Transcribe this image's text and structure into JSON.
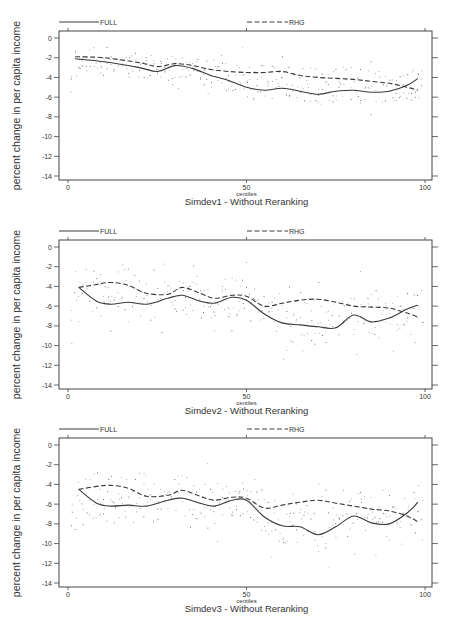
{
  "figure": {
    "panels_count": 3
  },
  "chart_data": [
    {
      "type": "line",
      "title": "Simdev1 - Without Reranking",
      "xlabel": "centiles",
      "ylabel": "percent change in per capita income",
      "xlim": [
        0,
        100
      ],
      "ylim": [
        -14,
        0
      ],
      "xticks": [
        0,
        50,
        100
      ],
      "yticks": [
        0,
        -2,
        -4,
        -6,
        -8,
        -10,
        -12,
        -14
      ],
      "grid": false,
      "legend": {
        "position": "top",
        "entries": [
          "FULL",
          "RHG"
        ]
      },
      "x": [
        2,
        10,
        20,
        25,
        30,
        35,
        40,
        45,
        50,
        55,
        60,
        65,
        70,
        75,
        80,
        85,
        90,
        95,
        98
      ],
      "series": [
        {
          "name": "FULL",
          "style": "solid",
          "values": [
            -2.1,
            -2.4,
            -3.0,
            -3.4,
            -2.8,
            -3.1,
            -3.8,
            -4.3,
            -5.0,
            -5.3,
            -5.1,
            -5.4,
            -5.7,
            -5.4,
            -5.3,
            -5.5,
            -5.4,
            -4.8,
            -4.1
          ]
        },
        {
          "name": "RHG",
          "style": "dashed",
          "values": [
            -1.9,
            -2.0,
            -2.5,
            -2.9,
            -2.6,
            -2.8,
            -3.2,
            -3.4,
            -3.5,
            -3.5,
            -3.4,
            -3.8,
            -4.0,
            -4.1,
            -4.2,
            -4.4,
            -4.6,
            -5.0,
            -5.3
          ]
        }
      ],
      "scatter_note": "raw centile observations shown as faint dots around both curves"
    },
    {
      "type": "line",
      "title": "Simdev2 - Without Reranking",
      "xlabel": "centiles",
      "ylabel": "percent change in per capita income",
      "xlim": [
        0,
        100
      ],
      "ylim": [
        -14,
        0
      ],
      "xticks": [
        0,
        50,
        100
      ],
      "yticks": [
        0,
        -2,
        -4,
        -6,
        -8,
        -10,
        -12,
        -14
      ],
      "grid": false,
      "legend": {
        "position": "top",
        "entries": [
          "FULL",
          "RHG"
        ]
      },
      "x": [
        3,
        8,
        12,
        17,
        22,
        28,
        32,
        37,
        41,
        46,
        50,
        55,
        60,
        65,
        70,
        75,
        80,
        85,
        90,
        95,
        98
      ],
      "series": [
        {
          "name": "FULL",
          "style": "solid",
          "values": [
            -4.1,
            -5.5,
            -5.8,
            -5.6,
            -5.8,
            -5.2,
            -4.9,
            -5.5,
            -5.7,
            -5.1,
            -5.4,
            -6.8,
            -7.7,
            -7.9,
            -8.1,
            -8.2,
            -6.9,
            -7.6,
            -7.2,
            -6.3,
            -5.9
          ]
        },
        {
          "name": "RHG",
          "style": "dashed",
          "values": [
            -4.1,
            -3.8,
            -3.6,
            -3.9,
            -4.7,
            -4.8,
            -4.1,
            -4.7,
            -5.2,
            -4.9,
            -5.0,
            -6.0,
            -5.7,
            -5.4,
            -5.3,
            -5.6,
            -6.0,
            -6.1,
            -6.2,
            -6.7,
            -7.1
          ]
        }
      ],
      "scatter_note": "raw centile observations shown as faint dots around both curves"
    },
    {
      "type": "line",
      "title": "Simdev3 - Without Reranking",
      "xlabel": "centiles",
      "ylabel": "percent change in per capita income",
      "xlim": [
        0,
        100
      ],
      "ylim": [
        -14,
        0
      ],
      "xticks": [
        0,
        50,
        100
      ],
      "yticks": [
        0,
        -2,
        -4,
        -6,
        -8,
        -10,
        -12,
        -14
      ],
      "grid": false,
      "legend": {
        "position": "top",
        "entries": [
          "FULL",
          "RHG"
        ]
      },
      "x": [
        3,
        8,
        12,
        17,
        22,
        28,
        32,
        37,
        41,
        46,
        50,
        55,
        60,
        65,
        70,
        75,
        80,
        85,
        90,
        95,
        98
      ],
      "series": [
        {
          "name": "FULL",
          "style": "solid",
          "values": [
            -4.5,
            -5.9,
            -6.2,
            -6.1,
            -6.2,
            -5.6,
            -5.4,
            -5.9,
            -6.2,
            -5.6,
            -5.6,
            -7.3,
            -8.2,
            -8.3,
            -9.1,
            -8.3,
            -7.2,
            -7.9,
            -8.0,
            -6.9,
            -5.8
          ]
        },
        {
          "name": "RHG",
          "style": "dashed",
          "values": [
            -4.5,
            -4.2,
            -4.1,
            -4.4,
            -5.2,
            -5.1,
            -4.6,
            -5.2,
            -5.6,
            -5.3,
            -5.4,
            -6.4,
            -6.1,
            -5.8,
            -5.6,
            -5.9,
            -6.2,
            -6.5,
            -6.7,
            -7.2,
            -7.8
          ]
        }
      ],
      "scatter_note": "raw centile observations shown as faint dots around both curves"
    }
  ],
  "panels": [
    {
      "title": "Simdev1 - Without Reranking",
      "xlabel": "centiles",
      "ylabel": "percent change in per capita income",
      "legend_full": "FULL",
      "legend_rhg": "RHG",
      "ytick_labels": [
        "0",
        "-2",
        "-4",
        "-6",
        "-8",
        "-10",
        "-12",
        "-14"
      ],
      "xtick_labels": [
        "0",
        "50",
        "100"
      ]
    },
    {
      "title": "Simdev2 - Without Reranking",
      "xlabel": "centiles",
      "ylabel": "percent change in per capita income",
      "legend_full": "FULL",
      "legend_rhg": "RHG",
      "ytick_labels": [
        "0",
        "-2",
        "-4",
        "-6",
        "-8",
        "-10",
        "-12",
        "-14"
      ],
      "xtick_labels": [
        "0",
        "50",
        "100"
      ]
    },
    {
      "title": "Simdev3 - Without Reranking",
      "xlabel": "centiles",
      "ylabel": "percent change in per capita income",
      "legend_full": "FULL",
      "legend_rhg": "RHG",
      "ytick_labels": [
        "0",
        "-2",
        "-4",
        "-6",
        "-8",
        "-10",
        "-12",
        "-14"
      ],
      "xtick_labels": [
        "0",
        "50",
        "100"
      ]
    }
  ],
  "colors": {
    "line": "#3a3a3a",
    "axis": "#444444",
    "dots": "#9a9a9a",
    "text": "#333333"
  }
}
